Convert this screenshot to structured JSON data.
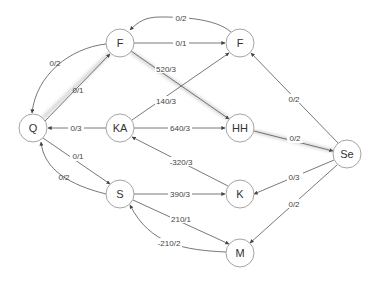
{
  "diagram": {
    "type": "flow-network",
    "nodes": [
      {
        "id": "Q",
        "label": "Q",
        "x": 33,
        "y": 128
      },
      {
        "id": "F1",
        "label": "F",
        "x": 120,
        "y": 43
      },
      {
        "id": "F2",
        "label": "F",
        "x": 240,
        "y": 43
      },
      {
        "id": "KA",
        "label": "KA",
        "x": 120,
        "y": 128
      },
      {
        "id": "HH",
        "label": "HH",
        "x": 240,
        "y": 128
      },
      {
        "id": "Se",
        "label": "Se",
        "x": 347,
        "y": 154
      },
      {
        "id": "S",
        "label": "S",
        "x": 120,
        "y": 194
      },
      {
        "id": "K",
        "label": "K",
        "x": 240,
        "y": 194
      },
      {
        "id": "M",
        "label": "M",
        "x": 240,
        "y": 253
      }
    ],
    "edges": [
      {
        "from": "F2",
        "to": "F1",
        "label": "0/2",
        "highlighted": false
      },
      {
        "from": "F1",
        "to": "F2",
        "label": "0/1",
        "highlighted": false
      },
      {
        "from": "F1",
        "to": "Q",
        "label": "0/2",
        "highlighted": false
      },
      {
        "from": "Q",
        "to": "F1",
        "label": "0/1",
        "highlighted": true
      },
      {
        "from": "F1",
        "to": "HH",
        "label": "520/3",
        "highlighted": true
      },
      {
        "from": "KA",
        "to": "F2",
        "label": "140/3",
        "highlighted": false
      },
      {
        "from": "KA",
        "to": "Q",
        "label": "0/3",
        "highlighted": false
      },
      {
        "from": "KA",
        "to": "HH",
        "label": "640/3",
        "highlighted": false
      },
      {
        "from": "HH",
        "to": "Se",
        "label": "0/2",
        "highlighted": true
      },
      {
        "from": "Se",
        "to": "F2",
        "label": "0/2",
        "highlighted": false
      },
      {
        "from": "K",
        "to": "KA",
        "label": "-320/3",
        "highlighted": false
      },
      {
        "from": "Q",
        "to": "S",
        "label": "0/1",
        "highlighted": false
      },
      {
        "from": "S",
        "to": "Q",
        "label": "0/2",
        "highlighted": false
      },
      {
        "from": "S",
        "to": "K",
        "label": "390/3",
        "highlighted": false
      },
      {
        "from": "Se",
        "to": "K",
        "label": "0/3",
        "highlighted": false
      },
      {
        "from": "S",
        "to": "M",
        "label": "210/1",
        "highlighted": false
      },
      {
        "from": "M",
        "to": "S",
        "label": "-210/2",
        "highlighted": false
      },
      {
        "from": "Se",
        "to": "M",
        "label": "0/2",
        "highlighted": false
      }
    ]
  },
  "labels": {
    "nodes": {
      "Q": "Q",
      "F1": "F",
      "F2": "F",
      "KA": "KA",
      "HH": "HH",
      "Se": "Se",
      "S": "S",
      "K": "K",
      "M": "M"
    },
    "edges": {
      "F2_F1": "0/2",
      "F1_F2": "0/1",
      "F1_Q": "0/2",
      "Q_F1": "0/1",
      "F1_HH": "520/3",
      "KA_F2": "140/3",
      "KA_Q": "0/3",
      "KA_HH": "640/3",
      "HH_Se": "0/2",
      "Se_F2": "0/2",
      "K_KA": "-320/3",
      "Q_S": "0/1",
      "S_Q": "0/2",
      "S_K": "390/3",
      "Se_K": "0/3",
      "S_M": "210/1",
      "M_S": "-210/2",
      "Se_M": "0/2"
    }
  }
}
